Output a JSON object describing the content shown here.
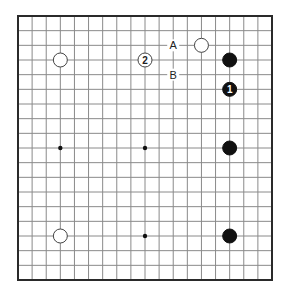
{
  "diagram": {
    "type": "go-board",
    "size": 19,
    "colors": {
      "background": "#ffffff",
      "grid": "#8a8a8a",
      "border": "#2a2a2a",
      "black": "#111111",
      "white": "#ffffff",
      "label": "#222222"
    },
    "star_points": [
      {
        "col": 3,
        "row": 9
      },
      {
        "col": 9,
        "row": 9
      },
      {
        "col": 9,
        "row": 15
      }
    ],
    "stones": [
      {
        "color": "white",
        "col": 13,
        "row": 2,
        "label": ""
      },
      {
        "color": "white",
        "col": 3,
        "row": 3,
        "label": ""
      },
      {
        "color": "white",
        "col": 9,
        "row": 3,
        "label": "2"
      },
      {
        "color": "black",
        "col": 15,
        "row": 3,
        "label": ""
      },
      {
        "color": "black",
        "col": 15,
        "row": 5,
        "label": "1"
      },
      {
        "color": "black",
        "col": 15,
        "row": 9,
        "label": ""
      },
      {
        "color": "white",
        "col": 3,
        "row": 15,
        "label": ""
      },
      {
        "color": "black",
        "col": 15,
        "row": 15,
        "label": ""
      }
    ],
    "markers": [
      {
        "text": "A",
        "col": 11,
        "row": 2
      },
      {
        "text": "B",
        "col": 11,
        "row": 4
      }
    ]
  }
}
